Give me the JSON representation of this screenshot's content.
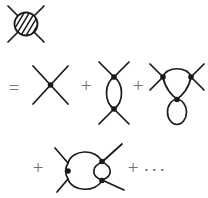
{
  "figure": {
    "type": "feynman-diagram-equation",
    "background_color": "#ffffff",
    "line_color": "#1a1a1a",
    "operator_color": "#6f6f6f",
    "width": 208,
    "height": 198
  },
  "operators": {
    "equals": "=",
    "plus": "+",
    "ellipsis": "···"
  },
  "terms": [
    {
      "index": 0,
      "role": "left-hand-side",
      "name": "full-four-point-vertex-blob",
      "label": "hatched blob with four external legs",
      "vertices": 0,
      "loops": "all orders",
      "external_legs": 4
    },
    {
      "index": 1,
      "role": "right-hand-side",
      "name": "tree-level-vertex",
      "label": "bare four-point vertex (X shape with one dot)",
      "vertices": 1,
      "loops": 0,
      "external_legs": 4
    },
    {
      "index": 2,
      "role": "right-hand-side",
      "name": "one-loop-bubble",
      "label": "vertical bubble: two vertices joined by two arcs",
      "vertices": 2,
      "loops": 1,
      "external_legs": 4
    },
    {
      "index": 3,
      "role": "right-hand-side",
      "name": "loop-with-tadpole",
      "label": "upper arc loop between two vertices plus a tadpole loop at the lower vertex",
      "vertices": 3,
      "loops": 2,
      "external_legs": 4
    },
    {
      "index": 4,
      "role": "right-hand-side",
      "name": "two-loop-sunset",
      "label": "left vertex with loop joined to a second nested loop between two right vertices",
      "vertices": 3,
      "loops": 2,
      "external_legs": 4
    }
  ],
  "rows": [
    {
      "name": "row-lhs",
      "contents": [
        "full-four-point-vertex-blob"
      ]
    },
    {
      "name": "row-first",
      "contents": [
        "=",
        "tree-level-vertex",
        "+",
        "one-loop-bubble",
        "+",
        "loop-with-tadpole"
      ]
    },
    {
      "name": "row-second",
      "contents": [
        "+",
        "two-loop-sunset",
        "+",
        "···"
      ]
    }
  ]
}
